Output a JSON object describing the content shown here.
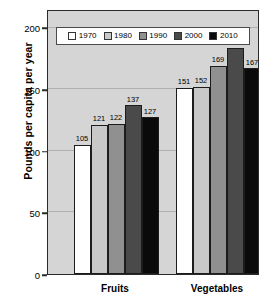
{
  "chart_data": {
    "type": "bar",
    "title": "",
    "xlabel": "",
    "ylabel": "Pounds per capita per year",
    "ylim": [
      0,
      215
    ],
    "yticks": [
      0,
      50,
      100,
      150,
      200
    ],
    "ytick_labels": [
      "0",
      "50",
      "100",
      "150",
      "200"
    ],
    "grid": true,
    "legend_position": "top-inside",
    "categories": [
      "Fruits",
      "Vegetables"
    ],
    "series": [
      {
        "name": "1970",
        "color": "#ffffff",
        "values": [
          105,
          151
        ]
      },
      {
        "name": "1980",
        "color": "#c8c8c8",
        "values": [
          121,
          152
        ]
      },
      {
        "name": "1990",
        "color": "#909090",
        "values": [
          122,
          169
        ]
      },
      {
        "name": "2000",
        "color": "#4a4a4a",
        "values": [
          137,
          183
        ]
      },
      {
        "name": "2010",
        "color": "#0a0a0a",
        "values": [
          127,
          167
        ]
      }
    ],
    "data_labels": {
      "Fruits": [
        "105",
        "121",
        "122",
        "137",
        "127"
      ],
      "Vegetables": [
        "151",
        "152",
        "169",
        "183",
        "167"
      ]
    }
  },
  "legend": {
    "items": [
      {
        "label": "1970",
        "color": "#ffffff"
      },
      {
        "label": "1980",
        "color": "#c8c8c8"
      },
      {
        "label": "1990",
        "color": "#909090"
      },
      {
        "label": "2000",
        "color": "#4a4a4a"
      },
      {
        "label": "2010",
        "color": "#0a0a0a"
      }
    ]
  },
  "colors": {
    "plot_background": "#d5d5d5",
    "frame": "#2a2a2a",
    "gridline": "#a8a8a8",
    "legend_background": "#ffffff",
    "text": "#000000"
  }
}
